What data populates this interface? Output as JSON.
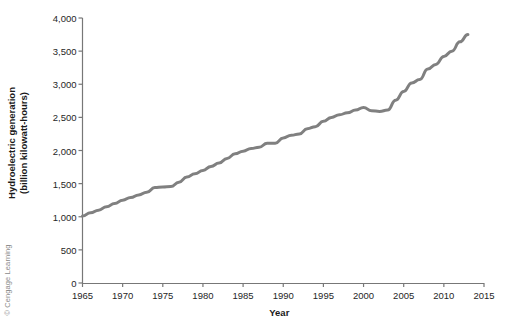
{
  "figure": {
    "credit": "© Cengage Learning",
    "background": "#ffffff"
  },
  "chart_data": {
    "type": "line",
    "title": "",
    "xlabel": "Year",
    "ylabel": "Hydroelectric generation\n(billion kilowatt-hours)",
    "ylabel_line1": "Hydroelectric generation",
    "ylabel_line2": "(billion kilowatt-hours)",
    "grid": false,
    "legend": "none",
    "line_color": "#808080",
    "line_width": 3,
    "xlim": [
      1965,
      2015
    ],
    "ylim": [
      0,
      4000
    ],
    "xticks": [
      1965,
      1970,
      1975,
      1980,
      1985,
      1990,
      1995,
      2000,
      2005,
      2010,
      2015
    ],
    "xtick_labels": [
      "1965",
      "1970",
      "1975",
      "1980",
      "1985",
      "1990",
      "1995",
      "2000",
      "2005",
      "2010",
      "2015"
    ],
    "yticks": [
      0,
      500,
      1000,
      1500,
      2000,
      2500,
      3000,
      3500,
      4000
    ],
    "ytick_labels": [
      "0",
      "500",
      "1,000",
      "1,500",
      "2,000",
      "2,500",
      "3,000",
      "3,500",
      "4,000"
    ],
    "series": [
      {
        "name": "World hydroelectric generation",
        "color": "#808080",
        "x": [
          1965,
          1966,
          1967,
          1968,
          1969,
          1970,
          1971,
          1972,
          1973,
          1974,
          1975,
          1976,
          1977,
          1978,
          1979,
          1980,
          1981,
          1982,
          1983,
          1984,
          1985,
          1986,
          1987,
          1988,
          1989,
          1990,
          1991,
          1992,
          1993,
          1994,
          1995,
          1996,
          1997,
          1998,
          1999,
          2000,
          2001,
          2002,
          2003,
          2004,
          2005,
          2006,
          2007,
          2008,
          2009,
          2010,
          2011,
          2012,
          2013
        ],
        "values": [
          1010,
          1060,
          1100,
          1150,
          1200,
          1250,
          1290,
          1330,
          1370,
          1440,
          1450,
          1455,
          1520,
          1600,
          1650,
          1700,
          1760,
          1810,
          1880,
          1950,
          1990,
          2030,
          2050,
          2110,
          2110,
          2190,
          2230,
          2250,
          2330,
          2360,
          2440,
          2500,
          2540,
          2570,
          2610,
          2650,
          2600,
          2590,
          2610,
          2760,
          2890,
          3020,
          3070,
          3230,
          3300,
          3420,
          3500,
          3640,
          3750
        ]
      }
    ]
  }
}
